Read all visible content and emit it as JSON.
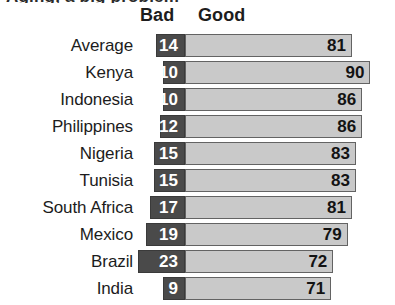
{
  "clipped_heading_text": "Aging, a big problem",
  "headers": {
    "bad_label": "Bad",
    "good_label": "Good"
  },
  "colors": {
    "bad_bar": "#4a4a4a",
    "good_bar": "#c9c9c9",
    "bar_border": "#5a5a5a",
    "bad_value_text": "#ffffff",
    "good_value_text": "#131313",
    "background": "#ffffff"
  },
  "chart_data": {
    "type": "bar",
    "title": "",
    "xlabel": "",
    "ylabel": "",
    "orientation": "horizontal",
    "layout": "diverging",
    "grid": false,
    "legend_position": "top",
    "categories": [
      "Average",
      "Kenya",
      "Indonesia",
      "Philippines",
      "Nigeria",
      "Tunisia",
      "South Africa",
      "Mexico",
      "Brazil",
      "India"
    ],
    "series": [
      {
        "name": "Bad",
        "values": [
          14,
          10,
          10,
          12,
          15,
          15,
          17,
          19,
          23,
          9
        ]
      },
      {
        "name": "Good",
        "values": [
          81,
          90,
          86,
          86,
          83,
          83,
          81,
          79,
          72,
          71
        ]
      }
    ],
    "units": "percent",
    "xlim": [
      0,
      100
    ]
  },
  "rows": [
    {
      "label": "Average",
      "bad": "14",
      "good": "81"
    },
    {
      "label": "Kenya",
      "bad": "10",
      "good": "90"
    },
    {
      "label": "Indonesia",
      "bad": "10",
      "good": "86"
    },
    {
      "label": "Philippines",
      "bad": "12",
      "good": "86"
    },
    {
      "label": "Nigeria",
      "bad": "15",
      "good": "83"
    },
    {
      "label": "Tunisia",
      "bad": "15",
      "good": "83"
    },
    {
      "label": "South Africa",
      "bad": "17",
      "good": "81"
    },
    {
      "label": "Mexico",
      "bad": "19",
      "good": "79"
    },
    {
      "label": "Brazil",
      "bad": "23",
      "good": "72"
    },
    {
      "label": "India",
      "bad": "9",
      "good": "71"
    }
  ]
}
